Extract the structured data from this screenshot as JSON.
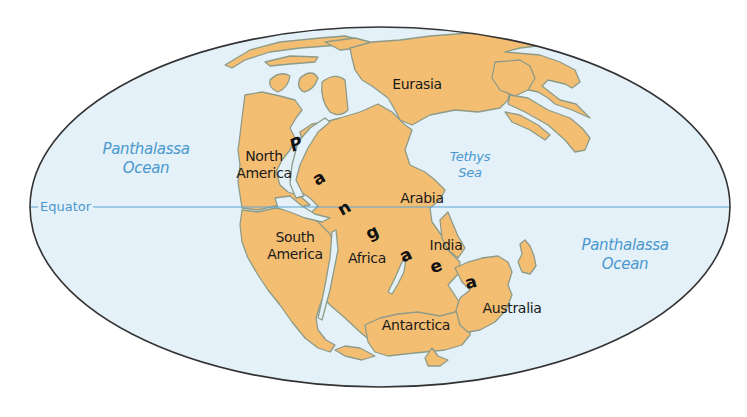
{
  "map": {
    "title": "Pangaea",
    "colors": {
      "land": "#f4be72",
      "land_outline": "#8d9b88",
      "ocean": "#e4f1f8",
      "outline": "#333333",
      "water_label": "#4a98cf",
      "equator_line": "#5aa6d6"
    },
    "equator_label": "Equator",
    "oceans": [
      {
        "line1": "Panthalassa",
        "line2": "Ocean",
        "position": "west"
      },
      {
        "line1": "Panthalassa",
        "line2": "Ocean",
        "position": "east"
      },
      {
        "line1": "Tethys",
        "line2": "Sea",
        "position": "center"
      }
    ],
    "landmasses": [
      {
        "name": "Eurasia"
      },
      {
        "line1": "North",
        "line2": "America"
      },
      {
        "line1": "South",
        "line2": "America"
      },
      {
        "name": "Africa"
      },
      {
        "name": "Arabia"
      },
      {
        "name": "India"
      },
      {
        "name": "Antarctica"
      },
      {
        "name": "Australia"
      }
    ],
    "supercontinent_letters": [
      "P",
      "a",
      "n",
      "g",
      "a",
      "e",
      "a"
    ]
  }
}
